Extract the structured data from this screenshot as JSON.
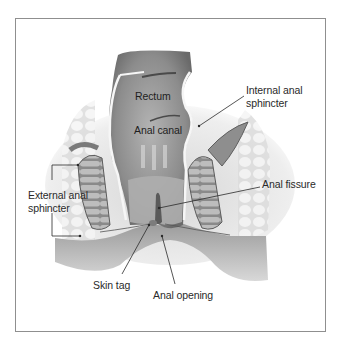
{
  "diagram": {
    "labels": {
      "rectum": "Rectum",
      "anal_canal": "Anal canal",
      "internal_sphincter_line1": "Internal anal",
      "internal_sphincter_line2": "sphincter",
      "anal_fissure": "Anal fissure",
      "external_sphincter_line1": "External anal",
      "external_sphincter_line2": "sphincter",
      "skin_tag": "Skin tag",
      "anal_opening": "Anal opening"
    },
    "colors": {
      "frame": "#8f8f8f",
      "tissue_dark": "#6e6e6e",
      "tissue_mid": "#9a9a9a",
      "tissue_light": "#c8c8c8",
      "fat": "#e4e4e4",
      "leader": "#2a2a2a"
    }
  }
}
